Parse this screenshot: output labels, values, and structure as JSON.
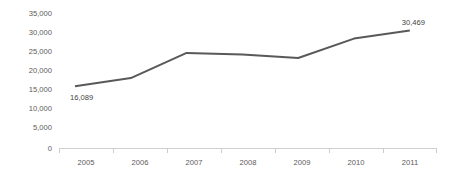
{
  "chart_data": {
    "type": "line",
    "title": "",
    "subtitle": "",
    "xlabel": "",
    "ylabel": "",
    "categories": [
      "2005",
      "2006",
      "2007",
      "2008",
      "2009",
      "2010",
      "2011"
    ],
    "x": [
      2005,
      2006,
      2007,
      2008,
      2009,
      2010,
      2011
    ],
    "values": [
      16089,
      18200,
      24700,
      24300,
      23400,
      28400,
      30469
    ],
    "series": [
      {
        "name": "",
        "values": [
          16089,
          18200,
          24700,
          24300,
          23400,
          28400,
          30469
        ],
        "color": "#595959"
      }
    ],
    "ylim": [
      0,
      35000
    ],
    "ytick_labels": [
      "0",
      "5,000",
      "10,000",
      "15,000",
      "20,000",
      "25,000",
      "30,000",
      "35,000"
    ],
    "ytick_values": [
      0,
      5000,
      10000,
      15000,
      20000,
      25000,
      30000,
      35000
    ],
    "xtick_labels": [
      "2005",
      "2006",
      "2007",
      "2008",
      "2009",
      "2010",
      "2011"
    ],
    "grid": false,
    "legend": false,
    "legend_position": "none",
    "annotations": [
      {
        "name": "first-point-value",
        "text": "16,089",
        "x": 2005,
        "y": 16089,
        "placement": "below-right"
      },
      {
        "name": "last-point-value",
        "text": "30,469",
        "x": 2011,
        "y": 30469,
        "placement": "above-left"
      }
    ],
    "data_labels": {
      "first": "16,089",
      "last": "30,469"
    },
    "colors": {
      "line": "#595959",
      "axis": "#d0d0d0",
      "tick_text": "#5a5a5a",
      "data_label_text": "#3f3f3f",
      "background": "#ffffff"
    }
  }
}
